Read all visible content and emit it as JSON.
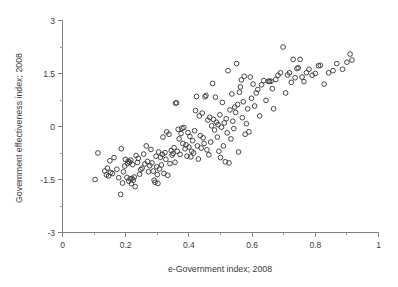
{
  "chart_data": {
    "type": "scatter",
    "title": "",
    "xlabel": "e-Government index; 2008",
    "ylabel": "Government effectiveness index; 2008",
    "xlim": [
      0,
      1
    ],
    "ylim": [
      -3,
      3
    ],
    "grid": false,
    "legend": null,
    "xticks": [
      0,
      0.2,
      0.4,
      0.6,
      0.8,
      1
    ],
    "xtick_labels": [
      "0",
      "0.2",
      "0.4",
      "0.6",
      "0.8",
      "1"
    ],
    "xticks_minor": [
      0.1,
      0.3,
      0.5,
      0.7,
      0.9
    ],
    "yticks": [
      -3,
      -1.5,
      0,
      1.5,
      3
    ],
    "ytick_labels": [
      "-3",
      "-1.5",
      "0",
      "1.5",
      "3"
    ],
    "yticks_minor": [
      -2.25,
      -0.75,
      0.75,
      2.25
    ],
    "marker": "open-circle",
    "marker_color": "#3d3d3d",
    "n_points": 184,
    "points": [
      [
        0.103,
        -1.5
      ],
      [
        0.112,
        -0.75
      ],
      [
        0.134,
        -1.26
      ],
      [
        0.139,
        -1.37
      ],
      [
        0.142,
        -1.18
      ],
      [
        0.146,
        -1.4
      ],
      [
        0.15,
        -0.97
      ],
      [
        0.152,
        -1.3
      ],
      [
        0.158,
        -1.33
      ],
      [
        0.163,
        -0.88
      ],
      [
        0.172,
        -1.21
      ],
      [
        0.178,
        -1.45
      ],
      [
        0.184,
        -1.92
      ],
      [
        0.186,
        -0.63
      ],
      [
        0.19,
        -1.6
      ],
      [
        0.193,
        -1.28
      ],
      [
        0.197,
        -1.12
      ],
      [
        0.199,
        -0.93
      ],
      [
        0.204,
        -1.44
      ],
      [
        0.206,
        -1.05
      ],
      [
        0.208,
        -0.98
      ],
      [
        0.21,
        -1.55
      ],
      [
        0.212,
        -1.01
      ],
      [
        0.214,
        -1.48
      ],
      [
        0.216,
        -0.95
      ],
      [
        0.218,
        -1.62
      ],
      [
        0.22,
        -1.47
      ],
      [
        0.222,
        -1.08
      ],
      [
        0.224,
        -1.52
      ],
      [
        0.227,
        -1.43
      ],
      [
        0.23,
        -1.7
      ],
      [
        0.233,
        -0.82
      ],
      [
        0.237,
        -1.02
      ],
      [
        0.24,
        -0.9
      ],
      [
        0.244,
        -1.35
      ],
      [
        0.248,
        -1.22
      ],
      [
        0.252,
        -1.18
      ],
      [
        0.257,
        -0.78
      ],
      [
        0.261,
        -1.06
      ],
      [
        0.265,
        -0.55
      ],
      [
        0.269,
        -0.99
      ],
      [
        0.272,
        -1.28
      ],
      [
        0.276,
        -1.11
      ],
      [
        0.28,
        -0.65
      ],
      [
        0.283,
        -1.03
      ],
      [
        0.287,
        -1.26
      ],
      [
        0.29,
        -1.52
      ],
      [
        0.293,
        -1.58
      ],
      [
        0.296,
        -0.84
      ],
      [
        0.298,
        -1.14
      ],
      [
        0.3,
        -1.36
      ],
      [
        0.302,
        -1.61
      ],
      [
        0.304,
        -0.72
      ],
      [
        0.307,
        -1.2
      ],
      [
        0.31,
        -0.87
      ],
      [
        0.313,
        -1.09
      ],
      [
        0.316,
        -0.79
      ],
      [
        0.318,
        -0.3
      ],
      [
        0.321,
        -1.33
      ],
      [
        0.324,
        -0.74
      ],
      [
        0.327,
        -0.93
      ],
      [
        0.33,
        -0.15
      ],
      [
        0.333,
        -1.38
      ],
      [
        0.337,
        -0.22
      ],
      [
        0.34,
        -1.05
      ],
      [
        0.344,
        -0.68
      ],
      [
        0.347,
        -0.81
      ],
      [
        0.35,
        -0.76
      ],
      [
        0.353,
        -0.6
      ],
      [
        0.356,
        -1.01
      ],
      [
        0.358,
        0.66
      ],
      [
        0.361,
        0.67
      ],
      [
        0.363,
        -0.7
      ],
      [
        0.366,
        -0.08
      ],
      [
        0.369,
        -0.35
      ],
      [
        0.372,
        -0.79
      ],
      [
        0.375,
        -0.2
      ],
      [
        0.378,
        -0.05
      ],
      [
        0.381,
        -0.48
      ],
      [
        0.384,
        -0.03
      ],
      [
        0.388,
        -0.63
      ],
      [
        0.391,
        -0.52
      ],
      [
        0.394,
        -0.84
      ],
      [
        0.397,
        -0.17
      ],
      [
        0.4,
        -0.58
      ],
      [
        0.403,
        -0.28
      ],
      [
        0.406,
        -0.86
      ],
      [
        0.409,
        -0.7
      ],
      [
        0.412,
        -0.4
      ],
      [
        0.415,
        -0.75
      ],
      [
        0.418,
        -0.12
      ],
      [
        0.421,
        0.45
      ],
      [
        0.424,
        0.85
      ],
      [
        0.427,
        -0.55
      ],
      [
        0.43,
        -0.92
      ],
      [
        0.433,
        0.3
      ],
      [
        0.436,
        -0.26
      ],
      [
        0.439,
        -0.61
      ],
      [
        0.442,
        0.38
      ],
      [
        0.445,
        -0.32
      ],
      [
        0.448,
        -0.48
      ],
      [
        0.451,
        0.84
      ],
      [
        0.454,
        0.88
      ],
      [
        0.457,
        -0.66
      ],
      [
        0.46,
        0.18
      ],
      [
        0.463,
        -0.8
      ],
      [
        0.466,
        0.26
      ],
      [
        0.469,
        -0.44
      ],
      [
        0.472,
        0.02
      ],
      [
        0.475,
        1.22
      ],
      [
        0.478,
        0.2
      ],
      [
        0.481,
        -0.1
      ],
      [
        0.484,
        0.83
      ],
      [
        0.487,
        0.12
      ],
      [
        0.49,
        -0.3
      ],
      [
        0.492,
        0.05
      ],
      [
        0.495,
        -0.7
      ],
      [
        0.498,
        0.33
      ],
      [
        0.5,
        -0.88
      ],
      [
        0.503,
        -0.02
      ],
      [
        0.506,
        0.68
      ],
      [
        0.509,
        -0.55
      ],
      [
        0.512,
        0.1
      ],
      [
        0.515,
        -1.0
      ],
      [
        0.518,
        0.22
      ],
      [
        0.521,
        -0.18
      ],
      [
        0.524,
        1.58
      ],
      [
        0.527,
        -1.03
      ],
      [
        0.53,
        0.47
      ],
      [
        0.533,
        -0.35
      ],
      [
        0.536,
        0.92
      ],
      [
        0.539,
        0.15
      ],
      [
        0.542,
        -0.06
      ],
      [
        0.545,
        0.55
      ],
      [
        0.548,
        0.4
      ],
      [
        0.551,
        1.78
      ],
      [
        0.554,
        0.62
      ],
      [
        0.557,
        -0.72
      ],
      [
        0.56,
        0.97
      ],
      [
        0.563,
        1.12
      ],
      [
        0.566,
        1.32
      ],
      [
        0.569,
        0.25
      ],
      [
        0.572,
        0.7
      ],
      [
        0.575,
        1.42
      ],
      [
        0.578,
        -0.22
      ],
      [
        0.582,
        0.08
      ],
      [
        0.586,
        0.5
      ],
      [
        0.59,
        -0.15
      ],
      [
        0.594,
        1.4
      ],
      [
        0.598,
        0.8
      ],
      [
        0.603,
        1.2
      ],
      [
        0.608,
        0.58
      ],
      [
        0.613,
        0.95
      ],
      [
        0.618,
        1.05
      ],
      [
        0.624,
        0.3
      ],
      [
        0.63,
        1.18
      ],
      [
        0.637,
        1.3
      ],
      [
        0.644,
        0.74
      ],
      [
        0.651,
        1.28
      ],
      [
        0.655,
        1.28
      ],
      [
        0.66,
        1.28
      ],
      [
        0.664,
        1.07
      ],
      [
        0.668,
        0.5
      ],
      [
        0.675,
        1.33
      ],
      [
        0.682,
        1.45
      ],
      [
        0.69,
        1.52
      ],
      [
        0.698,
        2.25
      ],
      [
        0.706,
        0.95
      ],
      [
        0.712,
        1.46
      ],
      [
        0.718,
        1.52
      ],
      [
        0.724,
        1.25
      ],
      [
        0.73,
        1.9
      ],
      [
        0.736,
        1.38
      ],
      [
        0.742,
        1.64
      ],
      [
        0.746,
        1.66
      ],
      [
        0.752,
        1.9
      ],
      [
        0.758,
        1.4
      ],
      [
        0.764,
        1.27
      ],
      [
        0.772,
        1.52
      ],
      [
        0.78,
        1.62
      ],
      [
        0.79,
        1.45
      ],
      [
        0.8,
        1.5
      ],
      [
        0.81,
        1.72
      ],
      [
        0.816,
        1.73
      ],
      [
        0.828,
        1.2
      ],
      [
        0.842,
        1.52
      ],
      [
        0.856,
        1.58
      ],
      [
        0.868,
        1.78
      ],
      [
        0.886,
        1.62
      ],
      [
        0.9,
        1.82
      ],
      [
        0.91,
        2.05
      ],
      [
        0.916,
        1.88
      ]
    ]
  }
}
